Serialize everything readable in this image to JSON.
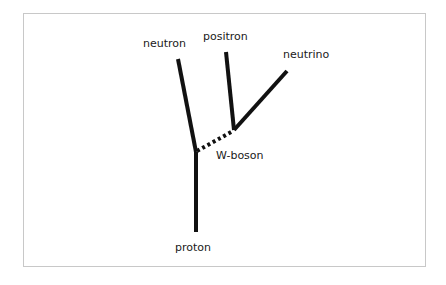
{
  "diagram": {
    "colors": {
      "line": "#111111",
      "border": "#c8c8c8",
      "background": "#ffffff"
    },
    "labels": {
      "neutron": "neutron",
      "positron": "positron",
      "neutrino": "neutrino",
      "w_boson": "W-boson",
      "proton": "proton"
    },
    "nodes": [
      {
        "id": "vertex1",
        "x": 196,
        "y": 152
      },
      {
        "id": "vertex2",
        "x": 234,
        "y": 130
      }
    ],
    "edges": [
      {
        "from": "proton",
        "to": "vertex1",
        "style": "solid"
      },
      {
        "from": "vertex1",
        "to": "neutron",
        "style": "solid"
      },
      {
        "from": "vertex1",
        "to": "vertex2",
        "style": "dashed",
        "label": "W-boson"
      },
      {
        "from": "vertex2",
        "to": "positron",
        "style": "solid"
      },
      {
        "from": "vertex2",
        "to": "neutrino",
        "style": "solid"
      }
    ]
  }
}
